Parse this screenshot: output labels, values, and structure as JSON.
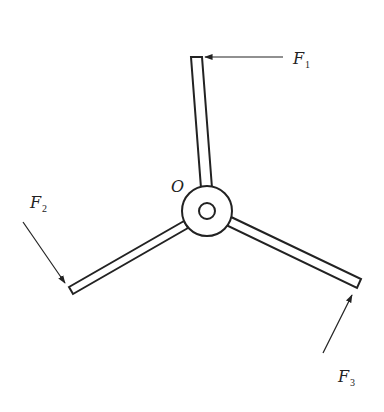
{
  "diagram": {
    "type": "force diagram on three-armed rigid body",
    "pivot": {
      "label": "O",
      "center": [
        207,
        211
      ],
      "outer_radius": 25,
      "inner_radius": 8
    },
    "colors": {
      "stroke": "#222222",
      "background": "#ffffff"
    },
    "arms": [
      {
        "name": "top",
        "polygon": [
          [
            191,
            57
          ],
          [
            202,
            57
          ],
          [
            212,
            188
          ],
          [
            201,
            188
          ]
        ]
      },
      {
        "name": "left",
        "polygon": [
          [
            69,
            287
          ],
          [
            73,
            294
          ],
          [
            188,
            228
          ],
          [
            184,
            221
          ]
        ]
      },
      {
        "name": "right",
        "polygon": [
          [
            229,
            216
          ],
          [
            226,
            225
          ],
          [
            357,
            288
          ],
          [
            361,
            279
          ]
        ]
      }
    ],
    "forces": [
      {
        "label": "F",
        "subscript": "1",
        "from": [
          283,
          57
        ],
        "to": [
          205,
          57
        ],
        "label_pos": [
          293,
          64
        ]
      },
      {
        "label": "F",
        "subscript": "2",
        "from": [
          23,
          222
        ],
        "to": [
          65,
          283
        ],
        "label_pos": [
          30,
          208
        ]
      },
      {
        "label": "F",
        "subscript": "3",
        "from": [
          323,
          353
        ],
        "to": [
          352,
          295
        ],
        "label_pos": [
          338,
          382
        ]
      }
    ]
  }
}
